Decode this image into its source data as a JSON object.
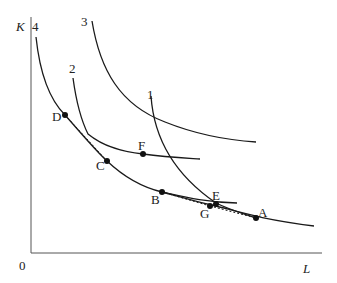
{
  "axes": {
    "y_label": "K",
    "x_label": "L",
    "origin_label": "0"
  },
  "curves": [
    {
      "id": "4",
      "label": "4"
    },
    {
      "id": "2",
      "label": "2"
    },
    {
      "id": "3",
      "label": "3"
    },
    {
      "id": "1",
      "label": "1"
    }
  ],
  "points": {
    "A": "A",
    "B": "B",
    "C": "C",
    "D": "D",
    "E": "E",
    "F": "F",
    "G": "G"
  },
  "colors": {
    "line": "#1a1a1a",
    "background": "#ffffff"
  }
}
